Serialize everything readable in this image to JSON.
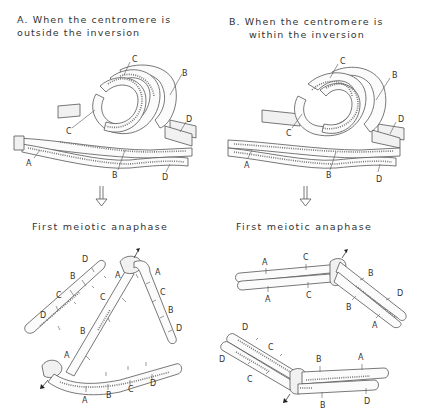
{
  "panels": [
    {
      "id": "A",
      "title_line1": "A. When the centromere is",
      "title_line2": "outside the inversion",
      "stage_label": "First meiotic anaphase",
      "pairing_labels": [
        "C",
        "B",
        "C",
        "D",
        "A",
        "B",
        "D"
      ],
      "anaphase_labels": {
        "fragment": [
          "D",
          "B",
          "C",
          "D"
        ],
        "dicentric_upper_left": [
          "A",
          "C",
          "B",
          "A"
        ],
        "dicentric_upper_right": [
          "A",
          "C",
          "B",
          "D"
        ],
        "dicentric_bottom": [
          "A",
          "B",
          "C",
          "D"
        ]
      }
    },
    {
      "id": "B",
      "title_line1": "B.  When the centromere is",
      "title_line2": "within the inversion",
      "stage_label": "First meiotic anaphase",
      "pairing_labels": [
        "C",
        "B",
        "C",
        "D",
        "A",
        "B",
        "D"
      ],
      "anaphase_labels": {
        "upper_chromatids": [
          "A",
          "C",
          "A",
          "C",
          "B",
          "D",
          "B",
          "A"
        ],
        "lower_chromatids": [
          "D",
          "C",
          "D",
          "C",
          "B",
          "A",
          "B",
          "D"
        ]
      }
    }
  ],
  "arrow_icon": "down-arrow-icon",
  "pole_marker_icon": "pole-arrow-icon"
}
